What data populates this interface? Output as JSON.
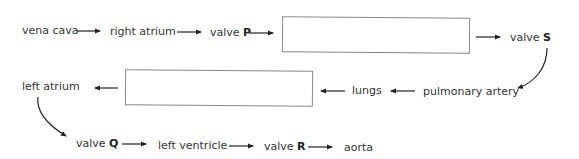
{
  "diagram": {
    "nodes": {
      "vena_cava": "vena cava",
      "right_atrium": "right atrium",
      "valve_p_prefix": "valve ",
      "valve_p_letter": "P",
      "valve_s_prefix": "valve ",
      "valve_s_letter": "S",
      "pulmonary_artery": "pulmonary artery",
      "lungs": "lungs",
      "left_atrium": "left atrium",
      "valve_q_prefix": "valve ",
      "valve_q_letter": "Q",
      "left_ventricle": "left ventricle",
      "valve_r_prefix": "valve ",
      "valve_r_letter": "R",
      "aorta": "aorta"
    },
    "blank_boxes": [
      {
        "id": "box-1",
        "value": ""
      },
      {
        "id": "box-2",
        "value": ""
      }
    ],
    "flow_order": [
      "vena cava",
      "right atrium",
      "valve P",
      "box-1",
      "valve S",
      "pulmonary artery",
      "lungs",
      "box-2",
      "left atrium",
      "valve Q",
      "left ventricle",
      "valve R",
      "aorta"
    ]
  }
}
